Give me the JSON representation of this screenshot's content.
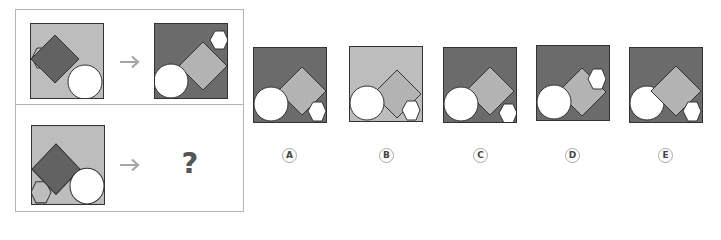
{
  "puzzle": {
    "question_mark": "?",
    "arrow_symbol": "arrow-right"
  },
  "colors": {
    "dark_bg": "#6b6b6b",
    "light_bg": "#bdbdbd",
    "light_shape": "#b3b3b3",
    "dark_shape": "#626262",
    "white": "#ffffff",
    "stroke": "#333333",
    "arrow": "#a6a6a6"
  },
  "options": [
    {
      "label": "A"
    },
    {
      "label": "B"
    },
    {
      "label": "C"
    },
    {
      "label": "D"
    },
    {
      "label": "E"
    }
  ]
}
